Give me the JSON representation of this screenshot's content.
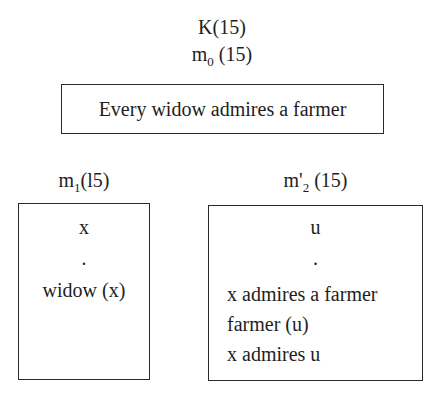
{
  "top": {
    "title": "K(15)",
    "main_drs_label": {
      "base": "m",
      "sub": "0",
      "suffix": " (15)"
    },
    "main_box_text": "Every widow admires a farmer"
  },
  "left": {
    "label": {
      "base": "m",
      "sub": "1",
      "suffix": "(l5)"
    },
    "box": {
      "referent": "x",
      "separator": ".",
      "conditions": [
        "widow (x)"
      ]
    }
  },
  "right": {
    "label": {
      "base": "m'",
      "sub": "2",
      "suffix": " (15)"
    },
    "box": {
      "referent": "u",
      "separator": ".",
      "conditions": [
        "x admires a farmer",
        "farmer (u)",
        "x admires u"
      ]
    }
  }
}
